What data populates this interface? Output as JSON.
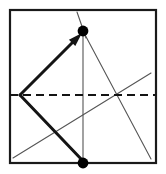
{
  "figure": {
    "title": "Origami fold diagram",
    "type": "paper-folding-diagram",
    "canvas": {
      "width": 166,
      "height": 174
    },
    "colors": {
      "background": "#ffffff",
      "frame": "#1a1a1a",
      "thick_line": "#141414",
      "thin_line": "#555555",
      "dashed_line": "#141414",
      "dot_fill": "#000000"
    },
    "paper": {
      "name": "square-sheet",
      "x": 10,
      "y": 10,
      "width": 146,
      "height": 153,
      "stroke_width": 2.2
    },
    "fold_line": {
      "name": "horizontal-fold-crease",
      "style": "dashed",
      "x1": 10,
      "y1": 95,
      "x2": 156,
      "y2": 95,
      "stroke_width": 2.2,
      "dash": "8 5"
    },
    "creases": [
      {
        "name": "vertical-crease",
        "x1": 83,
        "y1": 31,
        "x2": 83,
        "y2": 163,
        "stroke_width": 1.1
      },
      {
        "name": "short-crease-top",
        "x1": 77,
        "y1": 12,
        "x2": 86,
        "y2": 38,
        "stroke_width": 1.1
      },
      {
        "name": "crease-top-dot-to-bottom-right",
        "x1": 83,
        "y1": 31,
        "x2": 151,
        "y2": 159,
        "stroke_width": 1.1
      },
      {
        "name": "crease-bottom-left-to-right-edge",
        "x1": 13,
        "y1": 158,
        "x2": 151,
        "y2": 73,
        "stroke_width": 1.1
      }
    ],
    "fold_arrow": {
      "name": "fold-direction-arrow",
      "x1": 20,
      "y1": 95,
      "x2": 82,
      "y2": 33,
      "stroke_width": 3.0,
      "head_length": 14,
      "head_width": 9
    },
    "thick_edge": {
      "name": "folded-edge",
      "x1": 20,
      "y1": 95,
      "x2": 83,
      "y2": 161,
      "stroke_width": 3.0
    },
    "dots": [
      {
        "name": "reference-dot-top",
        "cx": 83,
        "cy": 31,
        "r": 5.4
      },
      {
        "name": "reference-dot-bottom",
        "cx": 83,
        "cy": 163,
        "r": 5.4
      }
    ]
  }
}
